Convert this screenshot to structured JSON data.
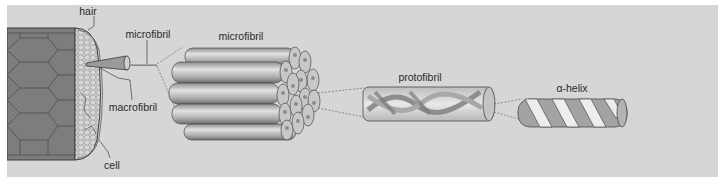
{
  "labels": {
    "hair": "hair",
    "cell": "cell",
    "macrofibril": "macrofibril",
    "microfibril_small": "microfibril",
    "microfibril_bundle": "microfibril",
    "protofibril": "protofibril",
    "alpha_helix": "α-helix"
  },
  "colors": {
    "background": "#d6d6d6",
    "hair_body": "#7d7d7d",
    "cell_face": "#c8c8c8",
    "cylinder": "#b4b4b4",
    "outline": "#4a4a4a",
    "label_text": "#2a2a2a"
  },
  "structure_levels": [
    "hair",
    "cell",
    "macrofibril",
    "microfibril",
    "protofibril",
    "α-helix"
  ]
}
